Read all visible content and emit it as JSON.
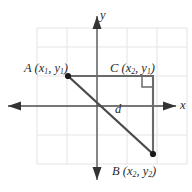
{
  "figure": {
    "background_color": "#ffffff",
    "grid_color": "#e3e3e3",
    "axis_color": "#4d4d4d",
    "segment_color": "#5a5a5a",
    "point_color": "#1a1a1a",
    "text_color": "#2b2b2b"
  },
  "axes": {
    "x_label": "x",
    "y_label": "y",
    "origin": {
      "x": 97,
      "y": 106
    },
    "x_range_px": [
      8,
      176
    ],
    "y_range_px": [
      16,
      180
    ]
  },
  "grid": {
    "left": 37,
    "top": 28,
    "right": 187,
    "bottom": 164,
    "v_lines": [
      37,
      67,
      97,
      127,
      157,
      187
    ],
    "h_lines": [
      28,
      47,
      76,
      106,
      135,
      164
    ]
  },
  "points": [
    {
      "id": "A",
      "name": "A",
      "label_main": "A",
      "coord_open": "(",
      "coord_x_var": "x",
      "coord_x_sub": "1",
      "coord_sep": ", ",
      "coord_y_var": "y",
      "coord_y_sub": "1",
      "coord_close": ")",
      "px": 68,
      "py": 76
    },
    {
      "id": "C",
      "name": "C",
      "label_main": "C",
      "coord_open": "(",
      "coord_x_var": "x",
      "coord_x_sub": "2",
      "coord_sep": ", ",
      "coord_y_var": "y",
      "coord_y_sub": "1",
      "coord_close": ")",
      "px": 153,
      "py": 76
    },
    {
      "id": "B",
      "name": "B",
      "label_main": "B",
      "coord_open": "(",
      "coord_x_var": "x",
      "coord_x_sub": "2",
      "coord_sep": ", ",
      "coord_y_var": "y",
      "coord_y_sub": "2",
      "coord_close": ")",
      "px": 153,
      "py": 154
    }
  ],
  "segments": {
    "leg_horizontal": {
      "from": "A",
      "to": "C",
      "label": ""
    },
    "leg_vertical": {
      "from": "C",
      "to": "B",
      "label": ""
    },
    "hypotenuse": {
      "from": "A",
      "to": "B",
      "label": "d"
    }
  },
  "distance_label": "d",
  "right_angle": {
    "at": "C",
    "size_px": 11,
    "marker": "right-angle-square"
  }
}
